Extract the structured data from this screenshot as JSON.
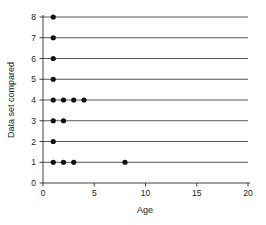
{
  "chart_data": {
    "type": "scatter",
    "title": "",
    "xlabel": "Age",
    "ylabel": "Data set compared",
    "xlim": [
      0,
      20
    ],
    "ylim": [
      0,
      8
    ],
    "xticks": [
      0,
      5,
      10,
      15,
      20
    ],
    "yticks": [
      0,
      1,
      2,
      3,
      4,
      5,
      6,
      7,
      8
    ],
    "xtick_labels": [
      "0",
      "5",
      "10",
      "15",
      "20"
    ],
    "ytick_labels": [
      "0",
      "1",
      "2",
      "3",
      "4",
      "5",
      "6",
      "7",
      "8"
    ],
    "grid": "horizontal gridlines at each integer y from 1 to 8",
    "legend": "none",
    "marker": "filled circle",
    "marker_color": "#111111",
    "gridline_color": "#2b2b2b",
    "series": [
      {
        "name": "Data set comparisons by age",
        "points": [
          {
            "x": 1,
            "y": 8
          },
          {
            "x": 1,
            "y": 7
          },
          {
            "x": 1,
            "y": 6
          },
          {
            "x": 1,
            "y": 5
          },
          {
            "x": 1,
            "y": 4
          },
          {
            "x": 2,
            "y": 4
          },
          {
            "x": 3,
            "y": 4
          },
          {
            "x": 4,
            "y": 4
          },
          {
            "x": 1,
            "y": 3
          },
          {
            "x": 2,
            "y": 3
          },
          {
            "x": 1,
            "y": 2
          },
          {
            "x": 1,
            "y": 1
          },
          {
            "x": 2,
            "y": 1
          },
          {
            "x": 3,
            "y": 1
          },
          {
            "x": 8,
            "y": 1
          }
        ]
      }
    ]
  },
  "axes": {
    "x_title": "Age",
    "y_title": "Data set compared",
    "x_tick_0": "0",
    "x_tick_1": "5",
    "x_tick_2": "10",
    "x_tick_3": "15",
    "x_tick_4": "20",
    "y_tick_0": "0",
    "y_tick_1": "1",
    "y_tick_2": "2",
    "y_tick_3": "3",
    "y_tick_4": "4",
    "y_tick_5": "5",
    "y_tick_6": "6",
    "y_tick_7": "7",
    "y_tick_8": "8"
  }
}
